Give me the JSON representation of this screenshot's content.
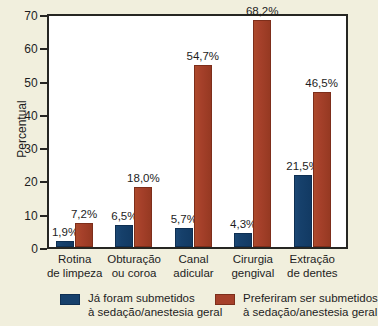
{
  "chart_data": {
    "type": "bar",
    "title": "",
    "xlabel": "",
    "ylabel": "Percentual",
    "ylim": [
      0,
      70
    ],
    "yticks": [
      0,
      10,
      20,
      30,
      40,
      50,
      60,
      70
    ],
    "ytick_labels": [
      "0",
      "10",
      "20",
      "30",
      "40",
      "50",
      "60",
      "70"
    ],
    "grid": false,
    "legend_position": "bottom",
    "categories": [
      "Rotina de limpeza",
      "Obturação ou coroa",
      "Canal adicular",
      "Cirurgia gengival",
      "Extração de dentes"
    ],
    "category_lines": [
      [
        "Rotina",
        "de limpeza"
      ],
      [
        "Obturação",
        "ou coroa"
      ],
      [
        "Canal",
        "adicular"
      ],
      [
        "Cirurgia",
        "gengival"
      ],
      [
        "Extração",
        "de dentes"
      ]
    ],
    "series": [
      {
        "name": "Já foram submetidos à sedação/anestesia geral",
        "color": "#16406b",
        "values": [
          1.9,
          6.5,
          5.7,
          4.3,
          21.5
        ],
        "data_labels": [
          "1,9%",
          "6,5%",
          "5,7%",
          "4,3%",
          "21,5%"
        ]
      },
      {
        "name": "Preferiram ser submetidos à sedação/anestesia geral",
        "color": "#a5402a",
        "values": [
          7.2,
          18.0,
          54.7,
          68.2,
          46.5
        ],
        "data_labels": [
          "7,2%",
          "18,0%",
          "54,7%",
          "68,2%",
          "46,5%"
        ]
      }
    ]
  },
  "legend": {
    "entries": [
      {
        "line1": "Já foram submetidos",
        "line2": "à sedação/anestesia geral"
      },
      {
        "line1": "Preferiram ser submetidos",
        "line2": "à sedação/anestesia geral"
      }
    ]
  }
}
